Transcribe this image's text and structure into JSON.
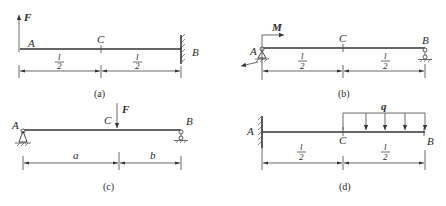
{
  "figures": [
    {
      "id": "a",
      "caption": "(a)",
      "description": "Cantilever beam fixed at B, upward force F at free end A",
      "labels": {
        "A": "A",
        "B": "B",
        "C": "C",
        "load": "F"
      },
      "dimensions": [
        {
          "num": "l",
          "den": "2"
        },
        {
          "num": "l",
          "den": "2"
        }
      ]
    },
    {
      "id": "b",
      "caption": "(b)",
      "description": "Simply supported beam, pin at A, roller at B, moment M at A",
      "labels": {
        "A": "A",
        "B": "B",
        "C": "C",
        "load": "M"
      },
      "dimensions": [
        {
          "num": "l",
          "den": "2"
        },
        {
          "num": "l",
          "den": "2"
        }
      ]
    },
    {
      "id": "c",
      "caption": "(c)",
      "description": "Simply supported beam with downward point load F at C",
      "labels": {
        "A": "A",
        "B": "B",
        "C": "C",
        "load": "F"
      },
      "dimensions": [
        {
          "label": "a"
        },
        {
          "label": "b"
        }
      ]
    },
    {
      "id": "d",
      "caption": "(d)",
      "description": "Cantilever fixed at A with uniformly distributed load q over CB",
      "labels": {
        "A": "A",
        "B": "B",
        "C": "C",
        "load": "q"
      },
      "dimensions": [
        {
          "num": "l",
          "den": "2"
        },
        {
          "num": "l",
          "den": "2"
        }
      ]
    }
  ]
}
